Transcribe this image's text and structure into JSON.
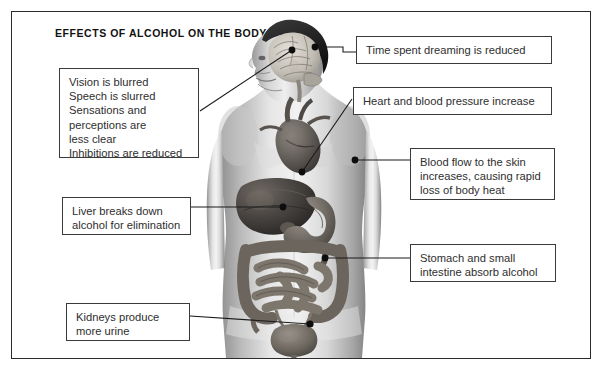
{
  "title": "EFFECTS OF ALCOHOL ON THE BODY",
  "figure": {
    "name": "human-body-anatomy-illustration"
  },
  "callouts": [
    {
      "id": "brain-effects",
      "organ": "brain",
      "text": "Vision is blurred\nSpeech is slurred\nSensations and\nperceptions are\nless clear\nInhibitions are reduced"
    },
    {
      "id": "dreaming",
      "organ": "brain",
      "text": "Time spent dreaming  is reduced"
    },
    {
      "id": "heart",
      "organ": "heart",
      "text": "Heart and blood pressure increase"
    },
    {
      "id": "skin-blood-flow",
      "organ": "skin",
      "text": "Blood flow to the skin\nincreases, causing rapid\nloss of body heat"
    },
    {
      "id": "liver",
      "organ": "liver",
      "text": "Liver breaks down\nalcohol for elimination"
    },
    {
      "id": "stomach",
      "organ": "stomach",
      "text": "Stomach and small\nintestine absorb alcohol"
    },
    {
      "id": "kidneys",
      "organ": "kidneys",
      "text": "Kidneys produce\nmore urine"
    }
  ],
  "colors": {
    "border": "#3a3a3a",
    "frame": "#2b2b2b",
    "text": "#2e2e2e",
    "leader": "#1a1a1a",
    "background": "#ffffff"
  }
}
